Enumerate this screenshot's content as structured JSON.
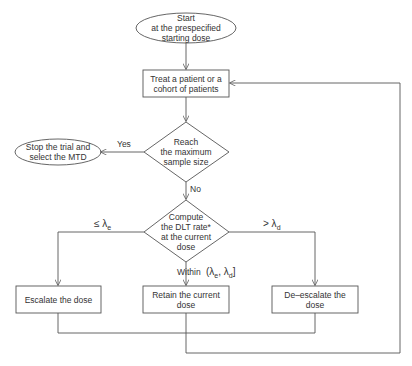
{
  "nodes": {
    "start": {
      "line1": "Start",
      "line2": "at the prespecified",
      "line3": "starting dose"
    },
    "treat": {
      "line1": "Treat a patient or a",
      "line2": "cohort of patients"
    },
    "decision_sample": {
      "line1": "Reach",
      "line2": "the maximum",
      "line3": "sample size"
    },
    "stop": {
      "line1": "Stop the trial and",
      "line2": "select the MTD"
    },
    "decision_dlt": {
      "line1": "Compute",
      "line2": "the DLT rate*",
      "line3": "at the current",
      "line4": "dose"
    },
    "escalate": {
      "line1": "Escalate the dose"
    },
    "retain": {
      "line1": "Retain the current",
      "line2": "dose"
    },
    "deescalate": {
      "line1": "De–escalate the",
      "line2": "dose"
    }
  },
  "edges": {
    "yes": "Yes",
    "no": "No",
    "le_lambda_e": "≤ λ",
    "le_sub": "e",
    "gt_lambda_d": "> λ",
    "gt_sub": "d",
    "within": "Within",
    "within_interval": "(λ",
    "within_sub_e": "e",
    "within_comma": ", λ",
    "within_sub_d": "d",
    "within_close": "]"
  },
  "colors": {
    "stroke": "#555555",
    "text": "#333333",
    "background": "#ffffff"
  }
}
